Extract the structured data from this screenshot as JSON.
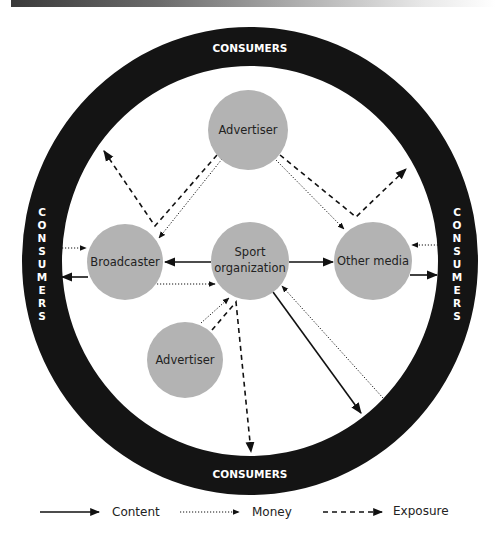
{
  "ring": {
    "label_top": "CONSUMERS",
    "label_bottom": "CONSUMERS",
    "label_left": [
      "C",
      "O",
      "N",
      "S",
      "U",
      "M",
      "E",
      "R",
      "S"
    ],
    "label_right": [
      "C",
      "O",
      "N",
      "S",
      "U",
      "M",
      "E",
      "R",
      "S"
    ],
    "color": "#141414"
  },
  "nodes": {
    "advertiser_top": "Advertiser",
    "broadcaster": "Broadcaster",
    "sport_org_line1": "Sport",
    "sport_org_line2": "organization",
    "other_media": "Other media",
    "advertiser_bottom": "Advertiser",
    "fill": "#b3b3b3"
  },
  "legend": {
    "content": "Content",
    "money": "Money",
    "exposure": "Exposure"
  }
}
